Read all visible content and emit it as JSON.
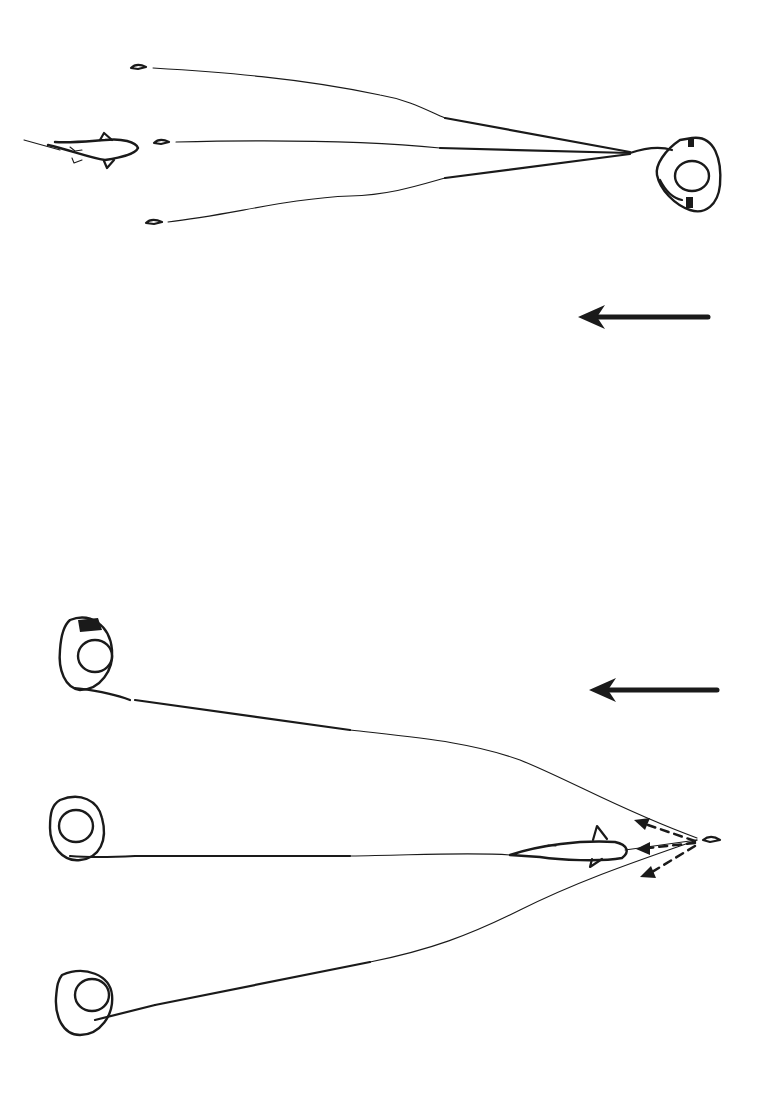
{
  "diagram": {
    "type": "illustration",
    "colors": {
      "ink": "#1a1a1a",
      "background": "#ffffff"
    },
    "panels": [
      {
        "id": "top",
        "elements": [
          "angler-single",
          "line-upper",
          "line-middle",
          "line-lower",
          "lure-upper",
          "lure-middle",
          "lure-lower",
          "fish-swimming-left"
        ],
        "direction_arrow": "left"
      },
      {
        "id": "bottom",
        "elements": [
          "angler-top",
          "angler-middle",
          "angler-bottom",
          "line-top",
          "line-middle",
          "line-bottom",
          "fish-hooked",
          "lure",
          "dashed-retrieve-arrows"
        ],
        "direction_arrow": "left"
      }
    ]
  }
}
